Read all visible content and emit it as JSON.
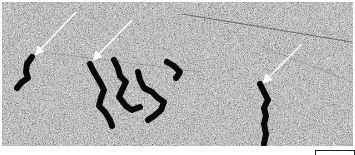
{
  "figure": {
    "type": "electron-micrograph",
    "colors": {
      "background": "#9a9a9a",
      "strand": "#0a0a0a",
      "arrow": "#ffffff"
    },
    "arrows": [
      {
        "id": 1,
        "tip": [
          34,
          52
        ],
        "tail": [
          74,
          10
        ]
      },
      {
        "id": 2,
        "tip": [
          92,
          57
        ],
        "tail": [
          130,
          18
        ]
      },
      {
        "id": 3,
        "tip": [
          262,
          80
        ],
        "tail": [
          300,
          42
        ]
      }
    ],
    "scale_bar": {
      "label": ""
    }
  }
}
